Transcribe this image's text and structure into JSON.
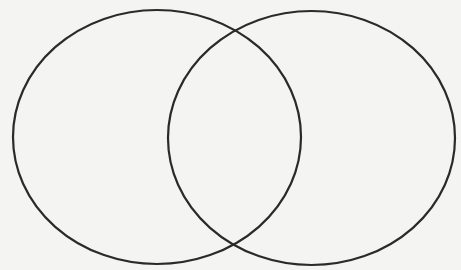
{
  "diagram": {
    "type": "venn",
    "set_count": 2,
    "sets": [
      {
        "id": "left",
        "label": ""
      },
      {
        "id": "right",
        "label": ""
      }
    ],
    "regions": {
      "left_only": "",
      "intersection": "",
      "right_only": ""
    },
    "colors": {
      "stroke": "#2a2a2a",
      "background": "#f4f4f3"
    }
  }
}
